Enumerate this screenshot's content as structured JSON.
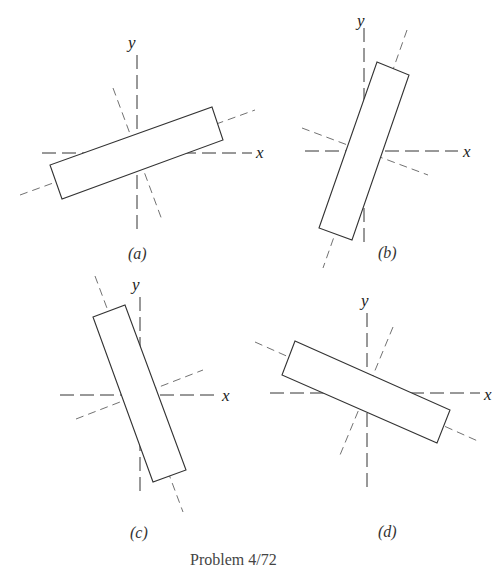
{
  "figure": {
    "caption": "Problem 4/72",
    "panels": [
      {
        "id": "a",
        "label": "(a)",
        "x_axis": "x",
        "y_axis": "y"
      },
      {
        "id": "b",
        "label": "(b)",
        "x_axis": "x",
        "y_axis": "y"
      },
      {
        "id": "c",
        "label": "(c)",
        "x_axis": "x",
        "y_axis": "y"
      },
      {
        "id": "d",
        "label": "(d)",
        "x_axis": "x",
        "y_axis": "y"
      }
    ]
  },
  "colors": {
    "line": "#333333",
    "dash": "#555555",
    "background": "#ffffff"
  }
}
